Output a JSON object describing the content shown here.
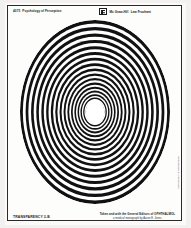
{
  "document": {
    "kind": "overhead-transparency-slide",
    "header": {
      "code": "4075",
      "title": "Psychology of Perception",
      "logo_icon": "publisher-logo-icon",
      "series": "Mc Graw-Hill",
      "edition": "Publishers and significant",
      "author": "Lew Fruchant"
    },
    "figure": {
      "name": "concentric-ellipse-moire-target",
      "ring_count": 46,
      "center_open": true,
      "outer_width_px": 150,
      "outer_height_px": 184,
      "ink_color": "#111111",
      "paper_color": "#ffffff"
    },
    "side_note": "Reproduced by permission",
    "footer": {
      "label": "TRANSPARENCY 3-B",
      "credit_line_1": "Taken and with the General Editors of OPHTHALMOL",
      "credit_line_2": "a medical monograph by Aaron E. Jones"
    }
  },
  "colors": {
    "frame": "#2a2a2a",
    "paper": "#fbfaf8",
    "page_margin": "#f2f1ef",
    "ink": "#1b1b1b"
  }
}
